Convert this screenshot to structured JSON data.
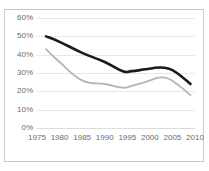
{
  "chart": {
    "title_fragment": "",
    "background": "#ffffff",
    "border_color": "#c9c9c9",
    "gridline_color": "#e8e8e8",
    "tick_label_color": "#6b6b6b"
  },
  "chart_data": {
    "type": "line",
    "title": "",
    "xlabel": "",
    "ylabel": "",
    "xlim": [
      1975,
      2010
    ],
    "ylim": [
      0,
      60
    ],
    "grid": true,
    "legend": "none",
    "x_ticks": [
      "1975",
      "1980",
      "1985",
      "1990",
      "1995",
      "2000",
      "2005",
      "2010"
    ],
    "x_tick_values": [
      1975,
      1980,
      1985,
      1990,
      1995,
      2000,
      2005,
      2010
    ],
    "y_ticks": [
      "0%",
      "10%",
      "20%",
      "30%",
      "40%",
      "50%",
      "60%"
    ],
    "y_tick_values": [
      0,
      10,
      20,
      30,
      40,
      50,
      60
    ],
    "series": [
      {
        "name": "series-dark",
        "color": "#1a1a1a",
        "width": 2.6,
        "x": [
          1977,
          1980,
          1985,
          1990,
          1994,
          1996,
          1999,
          2002,
          2004,
          2006,
          2009
        ],
        "values": [
          50.0,
          47.0,
          41.0,
          36.0,
          31.0,
          31.0,
          32.0,
          33.0,
          32.5,
          30.0,
          24.0
        ]
      },
      {
        "name": "series-light",
        "color": "#b5b5b5",
        "width": 1.8,
        "x": [
          1977,
          1980,
          1985,
          1990,
          1994,
          1996,
          1999,
          2002,
          2004,
          2006,
          2009
        ],
        "values": [
          43.0,
          36.0,
          26.0,
          24.0,
          22.0,
          23.0,
          25.0,
          27.5,
          27.0,
          24.0,
          18.0
        ]
      }
    ]
  }
}
